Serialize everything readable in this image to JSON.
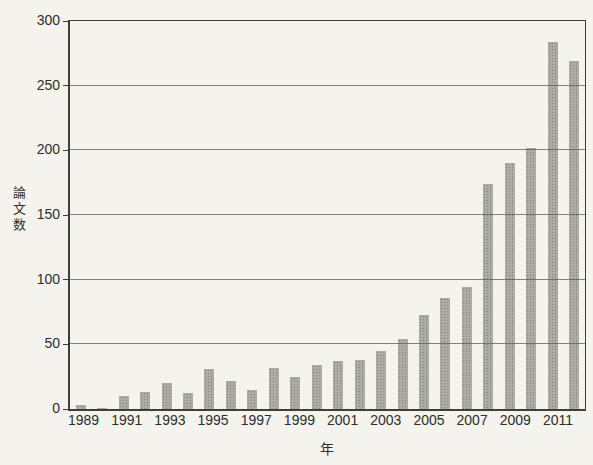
{
  "chart_data": {
    "type": "bar",
    "title": "",
    "xlabel": "年",
    "ylabel": "論文数",
    "categories": [
      1989,
      1990,
      1991,
      1992,
      1993,
      1994,
      1995,
      1996,
      1997,
      1998,
      1999,
      2000,
      2001,
      2002,
      2003,
      2004,
      2005,
      2006,
      2007,
      2008,
      2009,
      2010,
      2011,
      2012
    ],
    "values": [
      3,
      1,
      10,
      13,
      20,
      12,
      31,
      22,
      15,
      32,
      25,
      34,
      37,
      38,
      45,
      54,
      73,
      86,
      94,
      174,
      190,
      202,
      284,
      269
    ],
    "ylim": [
      0,
      300
    ],
    "y_tick_step": 50,
    "y_tick_labels": [
      "0",
      "50",
      "100",
      "150",
      "200",
      "250",
      "300"
    ],
    "x_tick_labels": [
      "1989",
      "1991",
      "1993",
      "1995",
      "1997",
      "1999",
      "2001",
      "2003",
      "2005",
      "2007",
      "2009",
      "2011"
    ],
    "x_tick_every": 2,
    "grid": true,
    "legend": false
  },
  "colors": {
    "background": "#f4f3ee",
    "bar": "#abaca4",
    "bar_dot": "#84857d",
    "axis": "#3f3f39",
    "gridline": "#5c5c54",
    "text": "#2e2e29"
  }
}
